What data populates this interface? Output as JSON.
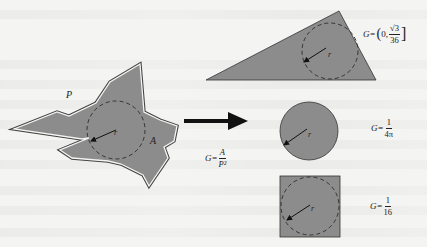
{
  "figure": {
    "labels": {
      "perimeter": "P",
      "area": "A",
      "radius": "r"
    },
    "formulas": {
      "general": {
        "lhs": "G=",
        "numerator": "A",
        "denominator": "P²"
      },
      "triangle": {
        "lhs": "G=",
        "open": "(",
        "first": "0,",
        "numerator": "√3",
        "denominator": "36",
        "close": "]"
      },
      "circle": {
        "lhs": "G=",
        "numerator": "1",
        "denominator": "4π"
      },
      "square": {
        "lhs": "G=",
        "numerator": "1",
        "denominator": "16"
      }
    },
    "shapes": [
      {
        "name": "irregular-polygon",
        "labels": [
          "P",
          "A",
          "r"
        ]
      },
      {
        "name": "triangle",
        "formula": "G=(0, √3/36]"
      },
      {
        "name": "circle",
        "formula": "G=1/4π"
      },
      {
        "name": "square",
        "formula": "G=1/16"
      }
    ],
    "colors": {
      "fill": "#8c8c8c",
      "stroke": "#333333",
      "background": "#f4f4f2"
    }
  }
}
